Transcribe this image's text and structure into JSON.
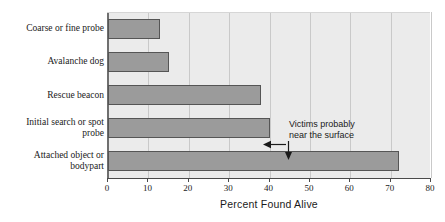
{
  "chart_data": {
    "type": "bar",
    "orientation": "horizontal",
    "title": "",
    "xlabel": "Percent Found Alive",
    "ylabel": "",
    "categories": [
      "Coarse or fine probe",
      "Avalanche dog",
      "Rescue beacon",
      "Initial search or spot probe",
      "Attached object or bodypart"
    ],
    "values": [
      13,
      15,
      38,
      40,
      72
    ],
    "xlim": [
      0,
      80
    ],
    "xticks": [
      0,
      10,
      20,
      30,
      40,
      50,
      60,
      70,
      80
    ],
    "xtick_labels": [
      "0",
      "10",
      "20",
      "30",
      "40",
      "50",
      "60",
      "70",
      "80"
    ],
    "grid": "vertical",
    "legend": "none",
    "annotations": [
      {
        "text_line_1": "Victims probably",
        "text_line_2": "near the surface",
        "points_to": [
          "Initial search or spot probe",
          "Attached object or bodypart"
        ]
      }
    ],
    "colors": {
      "bar_fill": "#9b9b9b",
      "bar_border": "#555555",
      "plot_background": "#ebebeb",
      "gridline": "#c9c9c9",
      "axis": "#4a4a4a",
      "text": "#1a1a1a"
    }
  },
  "category_label_lines": [
    [
      "Coarse or fine probe"
    ],
    [
      "Avalanche dog"
    ],
    [
      "Rescue beacon"
    ],
    [
      "Initial search or spot",
      "probe"
    ],
    [
      "Attached object or",
      "bodypart"
    ]
  ]
}
